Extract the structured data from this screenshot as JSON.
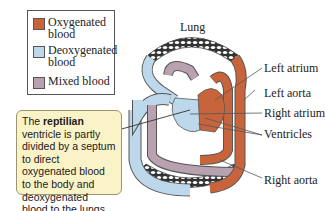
{
  "legend": {
    "items": [
      {
        "label_line1": "Oxygenated",
        "label_line2": "blood",
        "color": "#c8643c"
      },
      {
        "label_line1": "Deoxygenated",
        "label_line2": "blood",
        "color": "#bcd8ea"
      },
      {
        "label_line1": "Mixed blood",
        "label_line2": "",
        "color": "#b8a2b0"
      }
    ]
  },
  "callout": {
    "prefix": "The ",
    "bold": "reptilian",
    "suffix": " ventricle is partly divided by a septum to direct oxygenated blood to the body and deoxygenated blood to the lungs."
  },
  "labels": {
    "lung": "Lung",
    "left_atrium": "Left atrium",
    "left_aorta": "Left aorta",
    "right_atrium": "Right atrium",
    "ventricles": "Ventricles",
    "right_aorta": "Right aorta"
  },
  "colors": {
    "oxygenated": "#c8643c",
    "deoxygenated": "#bcd8ea",
    "mixed": "#b8a2b0",
    "callout_bg": "#fbf3c8"
  }
}
